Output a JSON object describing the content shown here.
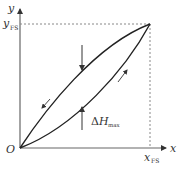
{
  "diagram": {
    "labels": {
      "y_axis": "y",
      "x_axis": "x",
      "origin": "O",
      "y_fs_main": "y",
      "y_fs_sub": "FS",
      "x_fs_main": "x",
      "x_fs_sub": "FS",
      "delta_symbol": "Δ",
      "delta_main": "H",
      "delta_sub": "max"
    },
    "colors": {
      "curve": "#222222",
      "axis": "#666666",
      "dashed": "#888888",
      "text": "#333333"
    },
    "curves": [
      {
        "name": "loading-curve",
        "direction": "up",
        "shape": "below-diagonal"
      },
      {
        "name": "unloading-curve",
        "direction": "down",
        "shape": "above-diagonal"
      }
    ],
    "annotation": "ΔHmax = maximum hysteresis difference between loading and unloading curves"
  }
}
